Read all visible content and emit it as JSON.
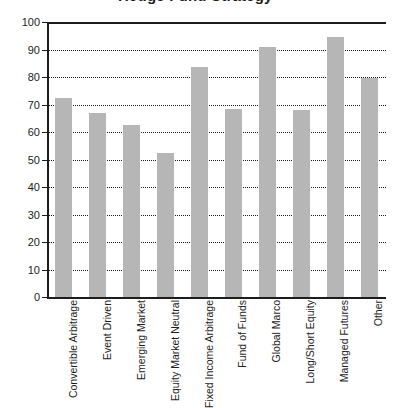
{
  "chart_data": {
    "type": "bar",
    "title": "Hedge Fund Strategy",
    "xlabel": "",
    "ylabel": "",
    "ylim": [
      0,
      100
    ],
    "yticks": [
      0,
      10,
      20,
      30,
      40,
      50,
      60,
      70,
      80,
      90,
      100
    ],
    "grid": true,
    "legend": "none",
    "bar_color": "#b6b6b6",
    "axis_color": "#1d1d1d",
    "categories": [
      "Convertible Arbitrage",
      "Event Driven",
      "Emerging Market",
      "Equity Market Neutral",
      "Fixed Income Arbitrage",
      "Fund of Funds",
      "Global Marco",
      "Long/Short Equity",
      "Managed Futures",
      "Other"
    ],
    "values": [
      72.5,
      67,
      62.5,
      52.5,
      83.5,
      68.5,
      91,
      68,
      94.5,
      79.5
    ]
  }
}
